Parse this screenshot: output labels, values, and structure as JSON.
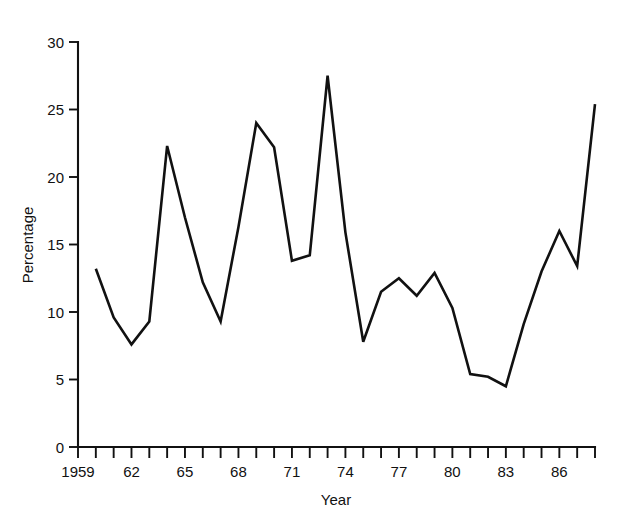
{
  "chart_data": {
    "type": "line",
    "title": "",
    "subtitle": "",
    "xlabel": "Year",
    "ylabel": "Percentage",
    "xlim": [
      1959,
      1988
    ],
    "ylim": [
      0,
      30
    ],
    "grid": false,
    "legend": "none",
    "line_color": "#111111",
    "background_color": "#ffffff",
    "y_ticks": [
      0,
      5,
      10,
      15,
      20,
      25,
      30
    ],
    "y_tick_labels": [
      "0",
      "5",
      "10",
      "15",
      "20",
      "25",
      "30"
    ],
    "x_tick_years": [
      1959,
      1960,
      1961,
      1962,
      1963,
      1964,
      1965,
      1966,
      1967,
      1968,
      1969,
      1970,
      1971,
      1972,
      1973,
      1974,
      1975,
      1976,
      1977,
      1978,
      1979,
      1980,
      1981,
      1982,
      1983,
      1984,
      1985,
      1986,
      1987,
      1988
    ],
    "x_tick_labels": [
      {
        "year": 1959,
        "label": "1959"
      },
      {
        "year": 1962,
        "label": "62"
      },
      {
        "year": 1965,
        "label": "65"
      },
      {
        "year": 1968,
        "label": "68"
      },
      {
        "year": 1971,
        "label": "71"
      },
      {
        "year": 1974,
        "label": "74"
      },
      {
        "year": 1977,
        "label": "77"
      },
      {
        "year": 1980,
        "label": "80"
      },
      {
        "year": 1983,
        "label": "83"
      },
      {
        "year": 1986,
        "label": "86"
      }
    ],
    "x": [
      1960,
      1961,
      1962,
      1963,
      1964,
      1965,
      1966,
      1967,
      1968,
      1969,
      1970,
      1971,
      1972,
      1973,
      1974,
      1975,
      1976,
      1977,
      1978,
      1979,
      1980,
      1981,
      1982,
      1983,
      1984,
      1985,
      1986,
      1987,
      1988
    ],
    "values": [
      13.2,
      9.6,
      7.6,
      9.3,
      22.3,
      17.0,
      12.2,
      9.3,
      16.3,
      24.0,
      22.2,
      13.8,
      14.2,
      27.5,
      15.9,
      7.8,
      11.5,
      12.5,
      11.2,
      12.9,
      10.3,
      5.4,
      5.2,
      4.5,
      9.1,
      13.0,
      16.0,
      13.4,
      25.4
    ],
    "series": [
      {
        "name": "Percentage",
        "values": [
          13.2,
          9.6,
          7.6,
          9.3,
          22.3,
          17.0,
          12.2,
          9.3,
          16.3,
          24.0,
          22.2,
          13.8,
          14.2,
          27.5,
          15.9,
          7.8,
          11.5,
          12.5,
          11.2,
          12.9,
          10.3,
          5.4,
          5.2,
          4.5,
          9.1,
          13.0,
          16.0,
          13.4,
          25.4
        ]
      }
    ]
  },
  "axes": {
    "y_title": "Percentage",
    "x_title": "Year"
  }
}
